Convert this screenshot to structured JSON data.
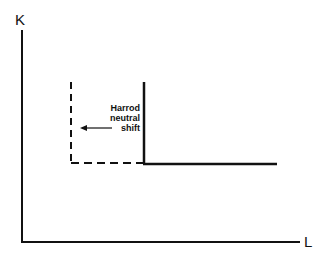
{
  "diagram": {
    "y_axis_label": "K",
    "x_axis_label": "L",
    "annotation": [
      "Harrod",
      "neutral",
      "shift"
    ],
    "colors": {
      "line": "#111111",
      "background": "#ffffff"
    }
  }
}
